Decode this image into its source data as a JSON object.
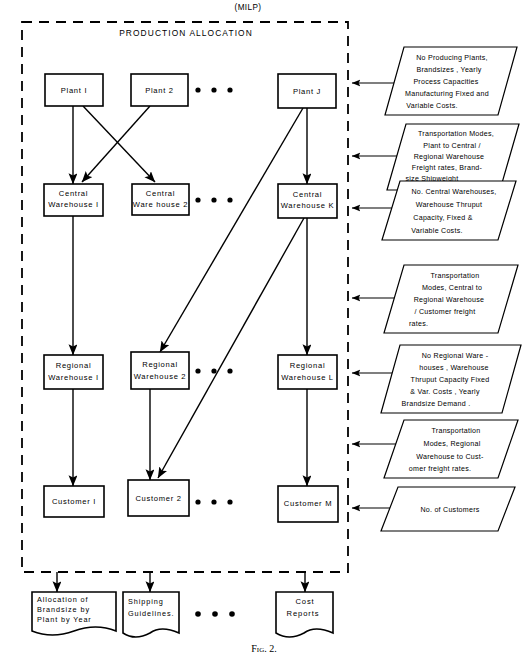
{
  "figure": {
    "top_title": "(MILP)",
    "caption": "Fig. 2.",
    "region_title": "PRODUCTION   ALLOCATION"
  },
  "nodes": {
    "plants": [
      {
        "id": "plant-1",
        "label_lines": [
          "Plant  I"
        ]
      },
      {
        "id": "plant-2",
        "label_lines": [
          "Plant 2"
        ]
      },
      {
        "id": "plant-j",
        "label_lines": [
          "Plant  J"
        ]
      }
    ],
    "central_warehouses": [
      {
        "id": "central-warehouse-1",
        "label_lines": [
          "Central",
          "Warehouse  I"
        ]
      },
      {
        "id": "central-warehouse-2",
        "label_lines": [
          "Central",
          "Ware house 2"
        ]
      },
      {
        "id": "central-warehouse-k",
        "label_lines": [
          "Central",
          "Warehouse K"
        ]
      }
    ],
    "regional_warehouses": [
      {
        "id": "regional-warehouse-1",
        "label_lines": [
          "Regional",
          "Warehouse  I"
        ]
      },
      {
        "id": "regional-warehouse-2",
        "label_lines": [
          "Regional",
          "Warehouse 2"
        ]
      },
      {
        "id": "regional-warehouse-l",
        "label_lines": [
          "Regional",
          "Warehouse L"
        ]
      }
    ],
    "customers": [
      {
        "id": "customer-1",
        "label_lines": [
          "Customer   I"
        ]
      },
      {
        "id": "customer-2",
        "label_lines": [
          "Customer 2"
        ]
      },
      {
        "id": "customer-m",
        "label_lines": [
          "Customer M"
        ]
      }
    ]
  },
  "inputs": [
    {
      "id": "input-plants",
      "lines": [
        "No Producing   Plants,",
        "Brandsizes , Yearly",
        "Process  Capacities",
        "Manufacturing  Fixed and",
        "Variable  Costs."
      ]
    },
    {
      "id": "input-transport-plant-to-warehouse",
      "lines": [
        "Transportation Modes,",
        "Plant  to  Central /",
        "Regional  Warehouse",
        "Freight  rates, Brand-",
        "size  Shipweight"
      ]
    },
    {
      "id": "input-central-warehouses",
      "lines": [
        "No. Central Warehouses,",
        "Warehouse  Thruput",
        "Capacity, Fixed  &",
        "Variable   Costs."
      ]
    },
    {
      "id": "input-transport-central-to-regional",
      "lines": [
        "Transportation",
        "Modes, Central to",
        "Regional  Warehouse",
        "/ Customer  freight",
        "rates."
      ]
    },
    {
      "id": "input-regional-warehouses",
      "lines": [
        "No Regional  Ware -",
        "houses , Warehouse",
        "Thruput Capacity Fixed",
        "&  Var. Costs , Yearly",
        "Brandsize   Demand ."
      ]
    },
    {
      "id": "input-transport-regional-to-customer",
      "lines": [
        "Transportation",
        "Modes,  Regional",
        "Warehouse  to  Cust-",
        "omer  freight rates."
      ]
    },
    {
      "id": "input-customers",
      "lines": [
        "No. of  Customers"
      ]
    }
  ],
  "outputs": [
    {
      "id": "output-allocation",
      "lines": [
        "Allocation  of",
        "Brandsize  by",
        "Plant  by Year"
      ]
    },
    {
      "id": "output-shipping-guidelines",
      "lines": [
        "Shipping",
        "Guidelines."
      ]
    },
    {
      "id": "output-cost-reports",
      "lines": [
        "Cost",
        "Reports"
      ]
    }
  ],
  "colors": {
    "ink": "#000000",
    "paper": "#ffffff"
  }
}
